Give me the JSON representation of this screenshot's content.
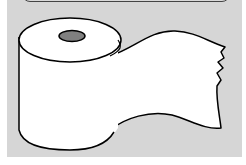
{
  "image": {
    "subject": "toilet-paper-roll",
    "colors": {
      "panel_background": "#d6d6d6",
      "paper": "#ffffff",
      "outline": "#000000",
      "core_hole": "#808080",
      "page_background": "#ffffff"
    }
  }
}
